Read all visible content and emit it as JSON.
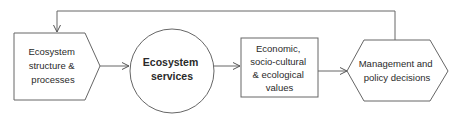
{
  "diagram": {
    "nodes": [
      {
        "id": "structure",
        "shape": "pentagon",
        "lines": [
          "Ecosystem",
          "structure &",
          "processes"
        ]
      },
      {
        "id": "services",
        "shape": "circle",
        "lines": [
          "Ecosystem",
          "services"
        ],
        "bold": true
      },
      {
        "id": "values",
        "shape": "rectangle",
        "lines": [
          "Economic,",
          "socio-cultural",
          "& ecological",
          "values"
        ]
      },
      {
        "id": "decisions",
        "shape": "hexagon",
        "lines": [
          "Management and",
          "policy decisions"
        ]
      }
    ],
    "edges": [
      {
        "from": "structure",
        "to": "services"
      },
      {
        "from": "services",
        "to": "values"
      },
      {
        "from": "values",
        "to": "decisions"
      },
      {
        "from": "decisions",
        "to": "structure",
        "type": "feedback"
      }
    ],
    "colors": {
      "stroke": "#555555",
      "text": "#2a2a2a",
      "background": "#ffffff"
    }
  }
}
